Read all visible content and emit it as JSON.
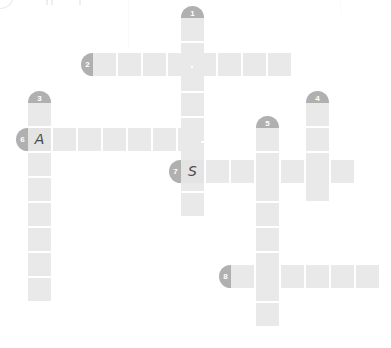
{
  "puzzle": {
    "title": "Crossword Puzzle Grid",
    "cell_size": 23,
    "cell_pitch": 25,
    "canvas_width": 391,
    "canvas_height": 348,
    "colors": {
      "cell": "#e9e9e9",
      "marker": "#b0b0b0",
      "marker_text": "#ffffff",
      "letter": "#4a4a4a",
      "background": "#ffffff"
    },
    "entries": [
      {
        "number": "1",
        "direction": "down",
        "length": 8,
        "start_x": 181,
        "start_y": 18,
        "marker_position": "up",
        "letters": [
          "",
          "",
          "",
          "",
          "",
          "",
          "",
          ""
        ]
      },
      {
        "number": "2",
        "direction": "across",
        "length": 8,
        "start_x": 93,
        "start_y": 53,
        "marker_position": "left",
        "letters": [
          "",
          "",
          "",
          "",
          "",
          "",
          "",
          ""
        ]
      },
      {
        "number": "3",
        "direction": "down",
        "length": 8,
        "start_x": 28,
        "start_y": 103,
        "marker_position": "up",
        "letters": [
          "",
          "A",
          "",
          "",
          "",
          "",
          "",
          ""
        ]
      },
      {
        "number": "4",
        "direction": "down",
        "length": 4,
        "start_x": 306,
        "start_y": 103,
        "marker_position": "up",
        "letters": [
          "",
          "",
          "",
          ""
        ]
      },
      {
        "number": "5",
        "direction": "down",
        "length": 8,
        "start_x": 256,
        "start_y": 128,
        "marker_position": "up",
        "letters": [
          "",
          "",
          "",
          "",
          "",
          "",
          "",
          ""
        ]
      },
      {
        "number": "6",
        "direction": "across",
        "length": 7,
        "start_x": 28,
        "start_y": 128,
        "marker_position": "left",
        "letters": [
          "A",
          "",
          "",
          "",
          "",
          "",
          ""
        ]
      },
      {
        "number": "7",
        "direction": "across",
        "length": 7,
        "start_x": 181,
        "start_y": 160,
        "marker_position": "left",
        "letters": [
          "S",
          "",
          "",
          "",
          "",
          "",
          ""
        ]
      },
      {
        "number": "8",
        "direction": "across",
        "length": 6,
        "start_x": 231,
        "start_y": 265,
        "marker_position": "left",
        "letters": [
          "",
          "",
          "",
          "",
          "",
          ""
        ]
      }
    ],
    "filled_letters": [
      {
        "letter": "A",
        "x": 28,
        "y": 128,
        "entry": "6"
      },
      {
        "letter": "S",
        "x": 181,
        "y": 160,
        "entry": "7"
      }
    ],
    "scan_artifacts": [
      {
        "type": "arc",
        "x": -14,
        "y": -12
      },
      {
        "type": "tick",
        "x": 46,
        "y": 0
      },
      {
        "type": "tick",
        "x": 51,
        "y": 0
      },
      {
        "type": "tick",
        "x": 79,
        "y": 0
      },
      {
        "type": "faintline",
        "x": 128,
        "y": 0,
        "height": 48
      },
      {
        "type": "faintline",
        "x": 340,
        "y": 0,
        "height": 14
      }
    ]
  }
}
